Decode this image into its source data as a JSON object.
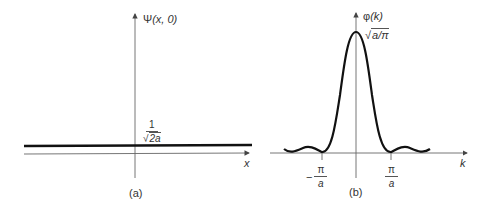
{
  "panel_a": {
    "caption": "(a)",
    "y_axis_label_func": "Ψ",
    "y_axis_label_args": "(x, 0)",
    "x_axis_label": "x",
    "level_label": {
      "numerator": "1",
      "radical": "√",
      "radicand": "2a"
    }
  },
  "panel_b": {
    "caption": "(b)",
    "y_axis_label_func": "φ",
    "y_axis_label_args": "(k)",
    "x_axis_label": "k",
    "peak_label": {
      "radical": "√",
      "radicand": "a/π"
    },
    "tick_left": {
      "sign": "−",
      "numerator": "π",
      "denominator": "a"
    },
    "tick_right": {
      "numerator": "π",
      "denominator": "a"
    }
  },
  "colors": {
    "axis": "#555555",
    "curve": "#111111",
    "background": "#ffffff"
  }
}
